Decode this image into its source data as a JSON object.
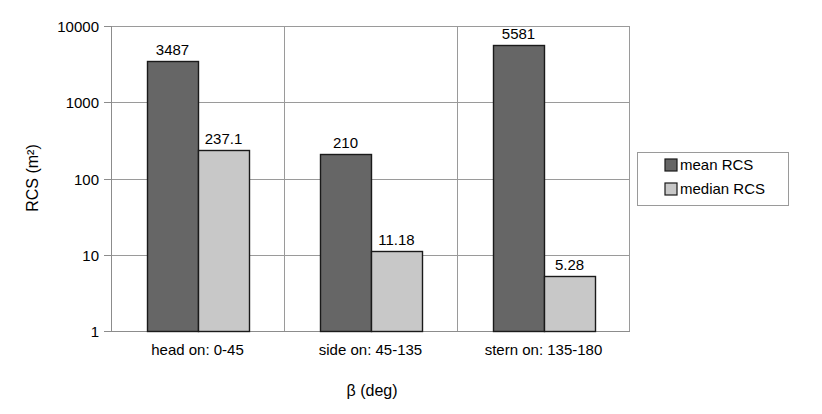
{
  "chart_data": {
    "type": "bar",
    "title": "",
    "xlabel": "β (deg)",
    "ylabel": "RCS (m²)",
    "yscale": "log",
    "ylim": [
      1,
      10000
    ],
    "yticks": [
      "1",
      "10",
      "100",
      "1000",
      "10000"
    ],
    "ytick_values": [
      1,
      10,
      100,
      1000,
      10000
    ],
    "grid": true,
    "legend_position": "right",
    "categories": [
      "head on:  0-45",
      "side on: 45-135",
      "stern on: 135-180"
    ],
    "series": [
      {
        "name": "mean RCS",
        "color": "#666666",
        "values": [
          3487,
          210,
          5581
        ],
        "labels": [
          "3487",
          "210",
          "5581"
        ]
      },
      {
        "name": "median RCS",
        "color": "#c8c8c8",
        "values": [
          237.1,
          11.18,
          5.28
        ],
        "labels": [
          "237.1",
          "11.18",
          "5.28"
        ]
      }
    ]
  },
  "legend": {
    "items": [
      {
        "label": "mean RCS",
        "color": "#666666"
      },
      {
        "label": "median RCS",
        "color": "#c8c8c8"
      }
    ]
  },
  "axes": {
    "y_title": "RCS (m²)",
    "x_title": "β (deg)"
  }
}
